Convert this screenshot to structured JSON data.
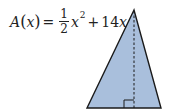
{
  "formula": {
    "function_name": "A",
    "variable": "x",
    "equals": "=",
    "frac_numerator": "1",
    "frac_denominator": "2",
    "term1_var": "x",
    "term1_exp": "2",
    "plus": "+",
    "term2_coef": "14",
    "term2_var": "x"
  },
  "diagram": {
    "shape": "triangle",
    "fill_color": "#a9bfdc",
    "stroke_color": "#1a1a1a",
    "vertices": {
      "apex": [
        134,
        10
      ],
      "bottom_left": [
        87,
        108
      ],
      "bottom_right": [
        161,
        108
      ]
    },
    "height_line": "dashed",
    "right_angle_marker": true
  }
}
